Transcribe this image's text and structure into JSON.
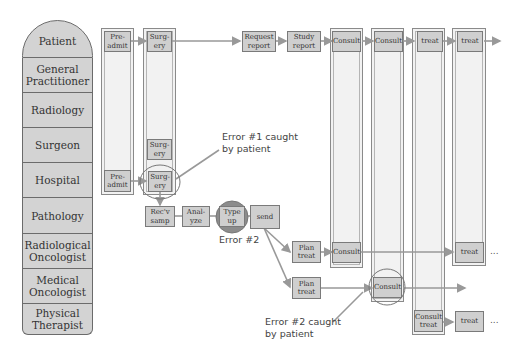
{
  "lanes": [
    {
      "label": "Patient"
    },
    {
      "label": "General Practitioner"
    },
    {
      "label": "Radiology"
    },
    {
      "label": "Surgeon"
    },
    {
      "label": "Hospital"
    },
    {
      "label": "Pathology"
    },
    {
      "label": "Radiological Oncologist"
    },
    {
      "label": "Medical Oncologist"
    },
    {
      "label": "Physical Therapist"
    }
  ],
  "steps": {
    "patient_preadmit": "Pre-\nadmit",
    "patient_surgery": "Surg-\nery",
    "request_report": "Request\nreport",
    "study_report": "Study\nreport",
    "consult_1": "Consult",
    "consult_2": "Consult",
    "treat_1": "treat",
    "treat_2": "treat",
    "surgeon_surgery": "Surg-\nery",
    "hospital_preadmit": "Pre-\nadmit",
    "hospital_surgery": "Surg-\nery",
    "recv_samp": "Rec'v\nsamp",
    "analyze": "Anal-\nyze",
    "type_up": "Type\nup",
    "send": "send",
    "radonc_plan_treat": "Plan\ntreat",
    "radonc_consult": "Consult",
    "radonc_treat": "treat",
    "medonc_plan_treat": "Plan\ntreat",
    "medonc_consult": "Consult",
    "pt_consult_treat": "Consult\ntreat",
    "pt_treat": "treat"
  },
  "annotations": {
    "error1": "Error #1 caught\nby patient",
    "error2": "Error #2",
    "error2_caught": "Error #2 caught\nby patient",
    "continuation": "..."
  },
  "colors": {
    "lane_fill": "#d3d3d3",
    "column_fill": "#f2f2f2",
    "box_fill": "#cfcfcf",
    "arrow": "#999999",
    "error_highlight": "#8c8c8c"
  }
}
